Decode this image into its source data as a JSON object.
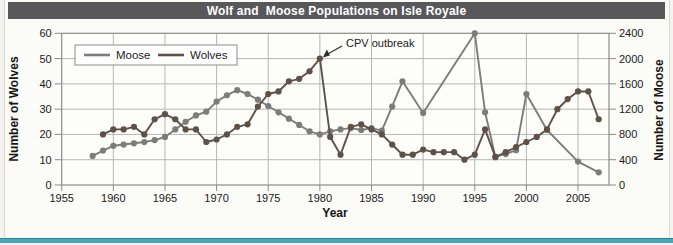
{
  "page": {
    "title": "Wolf and  Moose Populations on Isle Royale"
  },
  "chart_data": {
    "type": "line",
    "title": "Wolf and  Moose Populations on Isle Royale",
    "xlabel": "Year",
    "ylabel_left": "Number of Wolves",
    "ylabel_right": "Number of Moose",
    "grid": true,
    "legend_position": "top-left",
    "x_range": [
      1955,
      2008
    ],
    "x_ticks": [
      1955,
      1960,
      1965,
      1970,
      1975,
      1980,
      1985,
      1990,
      1995,
      2000,
      2005
    ],
    "y_left_range": [
      0,
      60
    ],
    "y_left_ticks": [
      0,
      10,
      20,
      30,
      40,
      50,
      60
    ],
    "y_right_range": [
      0,
      2400
    ],
    "y_right_ticks": [
      0,
      400,
      800,
      1200,
      1600,
      2000,
      2400
    ],
    "annotation": {
      "text": "CPV outbreak",
      "target_year": 1980,
      "target_value": 50,
      "target_series": "Wolves"
    },
    "series": [
      {
        "name": "Moose",
        "axis": "right",
        "color": "#7c7c7a",
        "points": [
          [
            1958,
            460
          ],
          [
            1959,
            545
          ],
          [
            1960,
            620
          ],
          [
            1961,
            640
          ],
          [
            1962,
            660
          ],
          [
            1963,
            680
          ],
          [
            1964,
            710
          ],
          [
            1965,
            760
          ],
          [
            1966,
            880
          ],
          [
            1967,
            1000
          ],
          [
            1968,
            1100
          ],
          [
            1969,
            1160
          ],
          [
            1970,
            1320
          ],
          [
            1971,
            1420
          ],
          [
            1972,
            1500
          ],
          [
            1973,
            1440
          ],
          [
            1974,
            1350
          ],
          [
            1975,
            1250
          ],
          [
            1976,
            1150
          ],
          [
            1977,
            1050
          ],
          [
            1978,
            950
          ],
          [
            1979,
            850
          ],
          [
            1980,
            800
          ],
          [
            1981,
            850
          ],
          [
            1982,
            880
          ],
          [
            1983,
            900
          ],
          [
            1984,
            870
          ],
          [
            1985,
            900
          ],
          [
            1986,
            860
          ],
          [
            1987,
            1240
          ],
          [
            1988,
            1640
          ],
          [
            1990,
            1140
          ],
          [
            1995,
            2400
          ],
          [
            1996,
            1150
          ],
          [
            1997,
            450
          ],
          [
            1998,
            490
          ],
          [
            1999,
            550
          ],
          [
            2000,
            1440
          ],
          [
            2002,
            870
          ],
          [
            2005,
            370
          ],
          [
            2007,
            200
          ]
        ]
      },
      {
        "name": "Wolves",
        "axis": "left",
        "color": "#5e5149",
        "points": [
          [
            1959,
            20
          ],
          [
            1960,
            22
          ],
          [
            1961,
            22
          ],
          [
            1962,
            23
          ],
          [
            1963,
            20
          ],
          [
            1964,
            26
          ],
          [
            1965,
            28
          ],
          [
            1966,
            26
          ],
          [
            1967,
            22
          ],
          [
            1968,
            22
          ],
          [
            1969,
            17
          ],
          [
            1970,
            18
          ],
          [
            1971,
            20
          ],
          [
            1972,
            23
          ],
          [
            1973,
            24
          ],
          [
            1974,
            31
          ],
          [
            1975,
            36
          ],
          [
            1976,
            37
          ],
          [
            1977,
            41
          ],
          [
            1978,
            42
          ],
          [
            1979,
            45
          ],
          [
            1980,
            50
          ],
          [
            1981,
            19
          ],
          [
            1982,
            12
          ],
          [
            1983,
            23
          ],
          [
            1984,
            24
          ],
          [
            1985,
            22
          ],
          [
            1986,
            20
          ],
          [
            1987,
            16
          ],
          [
            1988,
            12
          ],
          [
            1989,
            12
          ],
          [
            1990,
            14
          ],
          [
            1991,
            13
          ],
          [
            1992,
            13
          ],
          [
            1993,
            13
          ],
          [
            1994,
            10
          ],
          [
            1995,
            12
          ],
          [
            1996,
            22
          ],
          [
            1997,
            11
          ],
          [
            1998,
            13
          ],
          [
            1999,
            15
          ],
          [
            2000,
            17
          ],
          [
            2001,
            19
          ],
          [
            2002,
            22
          ],
          [
            2003,
            30
          ],
          [
            2004,
            34
          ],
          [
            2005,
            37
          ],
          [
            2006,
            37
          ],
          [
            2007,
            26
          ]
        ]
      }
    ]
  },
  "colors": {
    "title_bar": "#58585b",
    "title_text": "#ffffff",
    "grid": "#b6b6b6",
    "axis": "#8c8c8c",
    "plot_bg": "#fdfdfa",
    "tick_text": "#1a1a1a",
    "accent_rule": "#49a8bc"
  }
}
